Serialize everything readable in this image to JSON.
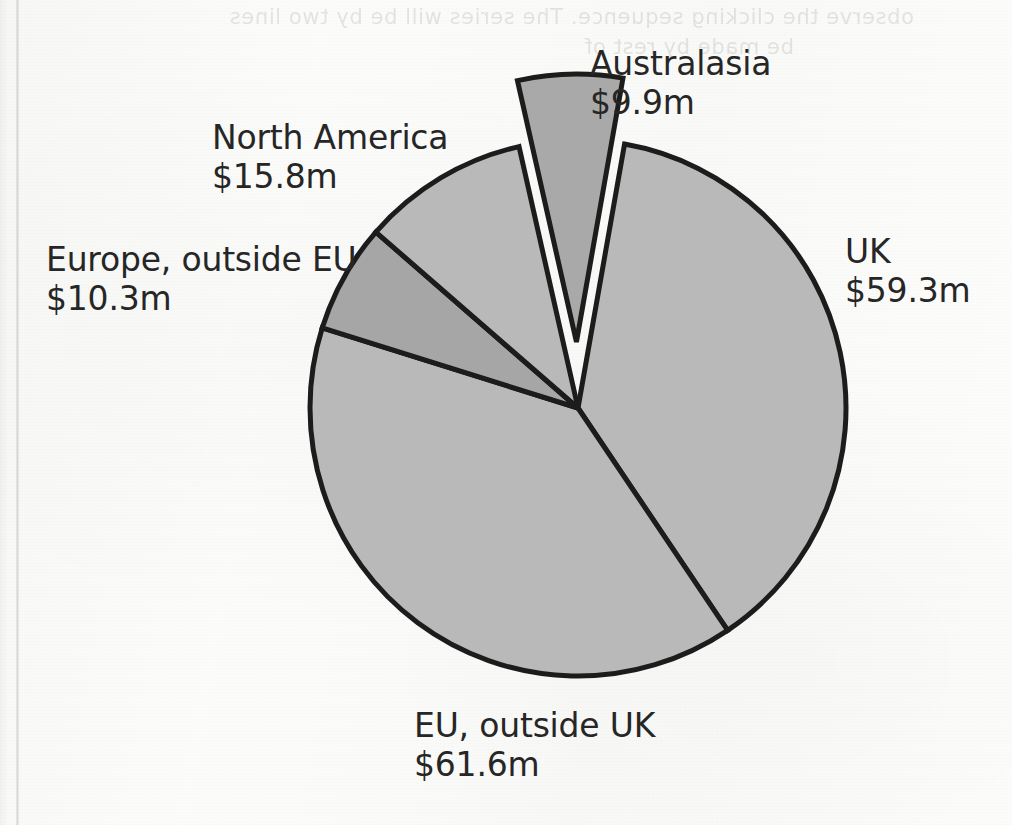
{
  "page": {
    "bleed_through_line1": "observe the clicking sequence. The series will be by two lines",
    "bleed_through_line2": "be made by rest of"
  },
  "chart_data": {
    "type": "pie",
    "title": "",
    "subtitle": "",
    "xlabel": "",
    "ylabel": "",
    "legend_position": "none",
    "grid": false,
    "unit": "$m",
    "total": 156.9,
    "categories": [
      "UK",
      "EU, outside UK",
      "Europe, outside EU",
      "North America",
      "Australasia"
    ],
    "values": [
      59.3,
      61.6,
      10.3,
      15.8,
      9.9
    ],
    "value_labels": [
      "$59.3m",
      "$61.6m",
      "$10.3m",
      "$15.8m",
      "$9.9m"
    ],
    "percentages": [
      37.8,
      39.3,
      6.6,
      10.1,
      6.3
    ],
    "start_angle_deg": -80,
    "direction": "clockwise",
    "center": {
      "x": 578,
      "y": 408
    },
    "radius": 268,
    "slices": [
      {
        "name": "UK",
        "label": "UK",
        "value_label": "$59.3m",
        "value": 59.3,
        "percent": 37.8,
        "fill": "#b9b9b9",
        "stroke": "#1c1c1c",
        "exploded": false
      },
      {
        "name": "EU, outside UK",
        "label": "EU, outside UK",
        "value_label": "$61.6m",
        "value": 61.6,
        "percent": 39.3,
        "fill": "#b9b9b9",
        "stroke": "#1c1c1c",
        "exploded": false
      },
      {
        "name": "Europe, outside EU",
        "label": "Europe, outside EU",
        "value_label": "$10.3m",
        "value": 10.3,
        "percent": 6.6,
        "fill": "#a6a6a6",
        "stroke": "#1c1c1c",
        "exploded": false
      },
      {
        "name": "North America",
        "label": "North America",
        "value_label": "$15.8m",
        "value": 15.8,
        "percent": 10.1,
        "fill": "#b9b9b9",
        "stroke": "#1c1c1c",
        "exploded": false
      },
      {
        "name": "Australasia",
        "label": "Australasia",
        "value_label": "$9.9m",
        "value": 9.9,
        "percent": 6.3,
        "fill": "#a9a9a9",
        "stroke": "#1c1c1c",
        "exploded": true
      }
    ]
  },
  "colors": {
    "slice_light": "#b9b9b9",
    "slice_dark": "#a6a6a6",
    "outline": "#1c1c1c",
    "label_text": "#262626",
    "page_background": "#fbfbfa"
  }
}
